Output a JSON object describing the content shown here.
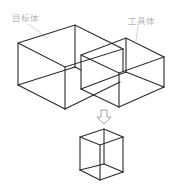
{
  "diagram": {
    "labels": {
      "target_body": "目标体",
      "tool_body": "工具体"
    },
    "colors": {
      "edge": "#2a2a2a",
      "label": "#b5b5b5",
      "arrow": "#9a9a9a"
    }
  }
}
